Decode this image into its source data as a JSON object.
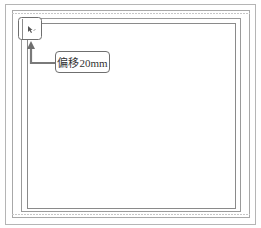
{
  "diagram": {
    "callout": {
      "label": "偏移20mm"
    },
    "colors": {
      "frame_line": "#a8a8a8",
      "inner_line": "#8a8a8a",
      "callout_border": "#6f6f6f",
      "arrow": "#7a7a7a",
      "text": "#333333"
    },
    "icons": {
      "corner_marker": "cursor-arrow-icon"
    }
  }
}
